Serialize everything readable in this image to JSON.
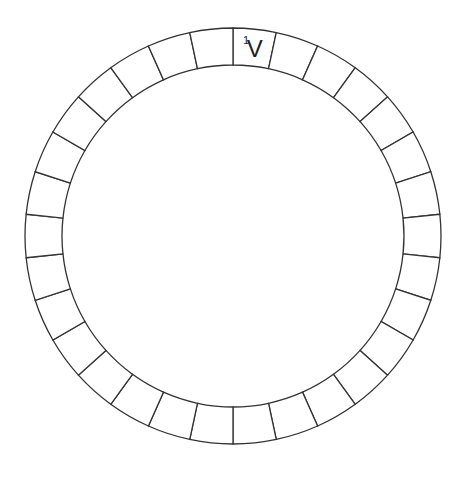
{
  "puzzle": {
    "type": "circular-word-ring",
    "cell_count": 30,
    "center": [
      233,
      236
    ],
    "outer_radius": 208,
    "inner_radius": 171,
    "stroke_color": "#333333",
    "background": "#ffffff",
    "clues": [
      {
        "cell_index": 0,
        "number": "1",
        "letter": "V"
      }
    ]
  }
}
